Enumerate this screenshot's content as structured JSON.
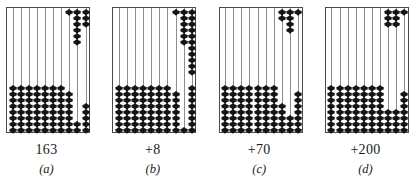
{
  "figure": {
    "panel_count": 4,
    "rod_count": 10,
    "frame": {
      "border_color": "#4a4a4a",
      "background_color": "#ffffff",
      "rod_color": "#8d8d8d",
      "bead_color": "#151515"
    }
  },
  "panels": [
    {
      "id": "panel-a",
      "value_label": "163",
      "index_label": "(a)",
      "top_beads": [
        0,
        0,
        0,
        0,
        0,
        0,
        0,
        1,
        6,
        3
      ],
      "bottom_beads": [
        8,
        8,
        8,
        8,
        8,
        8,
        8,
        7,
        2,
        5
      ]
    },
    {
      "id": "panel-b",
      "value_label": "+8",
      "index_label": "(b)",
      "top_beads": [
        0,
        0,
        0,
        0,
        0,
        0,
        0,
        1,
        6,
        11
      ],
      "bottom_beads": [
        8,
        8,
        8,
        8,
        8,
        8,
        8,
        7,
        1,
        8
      ]
    },
    {
      "id": "panel-c",
      "value_label": "+70",
      "index_label": "(c)",
      "top_beads": [
        0,
        0,
        0,
        0,
        0,
        0,
        0,
        2,
        4,
        1
      ],
      "bottom_beads": [
        8,
        8,
        8,
        8,
        8,
        8,
        8,
        5,
        3,
        7
      ]
    },
    {
      "id": "panel-d",
      "value_label": "+200",
      "index_label": "(d)",
      "top_beads": [
        0,
        0,
        0,
        0,
        0,
        0,
        0,
        3,
        3,
        1
      ],
      "bottom_beads": [
        8,
        8,
        8,
        8,
        8,
        8,
        8,
        4,
        4,
        7
      ]
    }
  ]
}
